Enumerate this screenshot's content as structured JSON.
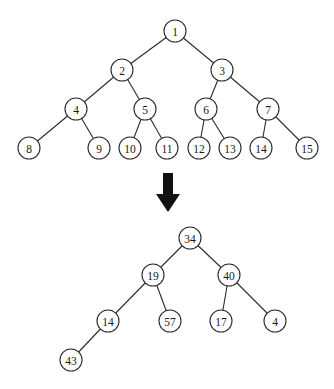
{
  "diagram": {
    "type": "tree-transformation",
    "top_tree": {
      "description": "complete binary tree with nodes numbered 1 to 15 in level order",
      "node_radius": 11,
      "nodes": [
        {
          "id": "t1",
          "label": "1",
          "x": 175,
          "y": 31
        },
        {
          "id": "t2",
          "label": "2",
          "x": 122,
          "y": 70
        },
        {
          "id": "t3",
          "label": "3",
          "x": 222,
          "y": 70
        },
        {
          "id": "t4",
          "label": "4",
          "x": 76,
          "y": 109
        },
        {
          "id": "t5",
          "label": "5",
          "x": 145,
          "y": 109
        },
        {
          "id": "t6",
          "label": "6",
          "x": 206,
          "y": 109
        },
        {
          "id": "t7",
          "label": "7",
          "x": 268,
          "y": 109
        },
        {
          "id": "t8",
          "label": "8",
          "x": 29,
          "y": 148
        },
        {
          "id": "t9",
          "label": "9",
          "x": 99,
          "y": 148
        },
        {
          "id": "t10",
          "label": "10",
          "x": 130,
          "y": 148
        },
        {
          "id": "t11",
          "label": "11",
          "x": 167,
          "y": 148
        },
        {
          "id": "t12",
          "label": "12",
          "x": 199,
          "y": 148
        },
        {
          "id": "t13",
          "label": "13",
          "x": 230,
          "y": 148
        },
        {
          "id": "t14",
          "label": "14",
          "x": 261,
          "y": 148
        },
        {
          "id": "t15",
          "label": "15",
          "x": 307,
          "y": 148
        }
      ],
      "edges": [
        [
          "t1",
          "t2"
        ],
        [
          "t1",
          "t3"
        ],
        [
          "t2",
          "t4"
        ],
        [
          "t2",
          "t5"
        ],
        [
          "t3",
          "t6"
        ],
        [
          "t3",
          "t7"
        ],
        [
          "t4",
          "t8"
        ],
        [
          "t4",
          "t9"
        ],
        [
          "t5",
          "t10"
        ],
        [
          "t5",
          "t11"
        ],
        [
          "t6",
          "t12"
        ],
        [
          "t6",
          "t13"
        ],
        [
          "t7",
          "t14"
        ],
        [
          "t7",
          "t15"
        ]
      ]
    },
    "arrow": {
      "direction": "down",
      "color": "#111111"
    },
    "bottom_tree": {
      "description": "binary tree with values",
      "node_radius": 11,
      "nodes": [
        {
          "id": "b34",
          "label": "34",
          "x": 190,
          "y": 238
        },
        {
          "id": "b19",
          "label": "19",
          "x": 153,
          "y": 275
        },
        {
          "id": "b40",
          "label": "40",
          "x": 229,
          "y": 275
        },
        {
          "id": "b14",
          "label": "14",
          "x": 108,
          "y": 321
        },
        {
          "id": "b57",
          "label": "57",
          "x": 170,
          "y": 321
        },
        {
          "id": "b17",
          "label": "17",
          "x": 221,
          "y": 321
        },
        {
          "id": "b4",
          "label": "4",
          "x": 275,
          "y": 321
        },
        {
          "id": "b43",
          "label": "43",
          "x": 71,
          "y": 360
        }
      ],
      "edges": [
        [
          "b34",
          "b19"
        ],
        [
          "b34",
          "b40"
        ],
        [
          "b19",
          "b14"
        ],
        [
          "b19",
          "b57"
        ],
        [
          "b40",
          "b17"
        ],
        [
          "b40",
          "b4"
        ],
        [
          "b14",
          "b43"
        ]
      ]
    }
  }
}
